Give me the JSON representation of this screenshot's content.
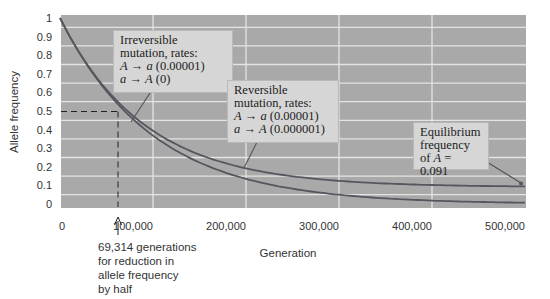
{
  "chart_data": {
    "type": "line",
    "title": "",
    "xlabel": "Generation",
    "ylabel": "Allele frequency",
    "xlim": [
      0,
      500000
    ],
    "ylim": [
      0,
      1
    ],
    "grid": true,
    "x_ticks": [
      "0",
      "100,000",
      "200,000",
      "300,000",
      "400,000",
      "500,000"
    ],
    "y_ticks": [
      "0",
      "0.1",
      "0.2",
      "0.3",
      "0.4",
      "0.5",
      "0.6",
      "0.7",
      "0.8",
      "0.9",
      "1"
    ],
    "series": [
      {
        "name": "Irreversible mutation",
        "x": [
          0,
          50000,
          69314,
          100000,
          150000,
          200000,
          300000,
          400000,
          500000
        ],
        "values": [
          1,
          0.607,
          0.5,
          0.368,
          0.223,
          0.135,
          0.05,
          0.018,
          0.007
        ]
      },
      {
        "name": "Reversible mutation",
        "x": [
          0,
          50000,
          100000,
          150000,
          200000,
          300000,
          400000,
          500000
        ],
        "values": [
          1,
          0.637,
          0.414,
          0.279,
          0.196,
          0.121,
          0.098,
          0.093
        ]
      }
    ],
    "annotations": [
      {
        "text": "Irreversible mutation, rates: A → a (0.00001), a → A (0)"
      },
      {
        "text": "Reversible mutation, rates: A → a (0.00001), a → A (0.000001)"
      },
      {
        "text": "Equilibrium frequency of A = 0.091"
      },
      {
        "text": "69,314 generations for reduction in allele frequency by half",
        "x": 69314,
        "y": 0.5
      }
    ]
  },
  "axes": {
    "xlabel": "Generation",
    "ylabel": "Allele frequency",
    "x_ticks": [
      "0",
      "100,000",
      "200,000",
      "300,000",
      "400,000",
      "500,000"
    ],
    "y_ticks": [
      "1",
      "0.9",
      "0.8",
      "0.7",
      "0.6",
      "0.5",
      "0.4",
      "0.3",
      "0.2",
      "0.1",
      "0"
    ]
  },
  "callouts": {
    "irreversible": {
      "line1": "Irreversible",
      "line2": "mutation, rates:",
      "line3_from": "A",
      "line3_arrow": "→",
      "line3_to": "a",
      "line3_rate": "(0.00001)",
      "line4_from": "a",
      "line4_arrow": "→",
      "line4_to": "A",
      "line4_rate": "(0)"
    },
    "reversible": {
      "line1": "Reversible",
      "line2": "mutation, rates:",
      "line3_from": "A",
      "line3_arrow": "→",
      "line3_to": "a",
      "line3_rate": "(0.00001)",
      "line4_from": "a",
      "line4_arrow": "→",
      "line4_to": "A",
      "line4_rate": "(0.000001)"
    },
    "equilibrium": {
      "line1": "Equilibrium",
      "line2": "frequency",
      "line3_prefix": "of",
      "line3_var": "A",
      "line3_value": "= 0.091"
    }
  },
  "half_life_note": {
    "line1": "69,314 generations",
    "line2": "for reduction in",
    "line3": "allele frequency",
    "line4": "by half"
  },
  "colors": {
    "plot_bg": "#a9a9a9",
    "grid": "#e4e4e4",
    "curve": "#55575e",
    "callout_bg": "#d6d6d6"
  }
}
